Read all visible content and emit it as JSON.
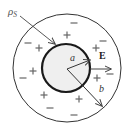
{
  "figure": {
    "colors": {
      "background": "#ffffff",
      "outer_circle": "#333333",
      "inner_circle": "#1a1a1a",
      "inner_fill": "#efefef",
      "charge_signs": "#666666",
      "arrows": "#444444",
      "labels": "#333333"
    },
    "geometry": {
      "center": [
        67,
        68
      ],
      "outer_radius": 54,
      "inner_radius": 24
    },
    "labels": {
      "surface_charge": "ρS",
      "surface_charge_main": "ρ",
      "surface_charge_sub": "S",
      "inner_radius": "a",
      "outer_radius": "b",
      "field": "E"
    },
    "plus_charges": [
      {
        "x": 67,
        "y": 35
      },
      {
        "x": 39,
        "y": 48
      },
      {
        "x": 96,
        "y": 48
      },
      {
        "x": 33,
        "y": 71
      },
      {
        "x": 97,
        "y": 78
      },
      {
        "x": 44,
        "y": 95
      },
      {
        "x": 79,
        "y": 99
      }
    ],
    "minus_charges": [
      {
        "x": 74,
        "y": 23
      },
      {
        "x": 28,
        "y": 43
      },
      {
        "x": 103,
        "y": 41
      },
      {
        "x": 23,
        "y": 78
      },
      {
        "x": 110,
        "y": 74
      },
      {
        "x": 50,
        "y": 108
      },
      {
        "x": 74,
        "y": 115
      }
    ]
  }
}
